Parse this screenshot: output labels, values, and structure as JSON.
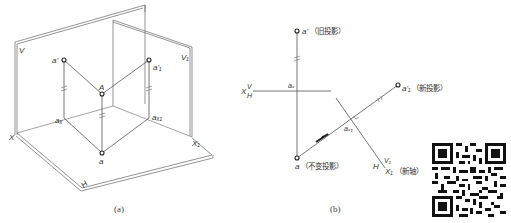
{
  "figure_a": {
    "caption": "(a)",
    "labels": {
      "V": "V",
      "V1": "V₁",
      "X": "X",
      "X1": "X₁",
      "H": "H",
      "A": "A",
      "a_prime": "a'",
      "a1_prime": "a'₁",
      "a_x": "aₓ",
      "a_x1": "aₓ₁",
      "a": "a"
    }
  },
  "figure_b": {
    "caption": "(b)",
    "labels": {
      "a_prime": "a'",
      "a_prime_note": "（旧投影）",
      "a_x": "aₓ",
      "X_axis": "X",
      "V": "V",
      "H": "H",
      "a1_prime": "a'₁",
      "a1_prime_note": "（新投影）",
      "a_x1": "aₓ₁",
      "a": "a",
      "a_note": "（不变投影）",
      "H_new": "H",
      "V1": "V₁",
      "X1": "X₁",
      "X1_note": "（新轴）"
    }
  },
  "qr_code": {
    "label": "qr-code"
  }
}
